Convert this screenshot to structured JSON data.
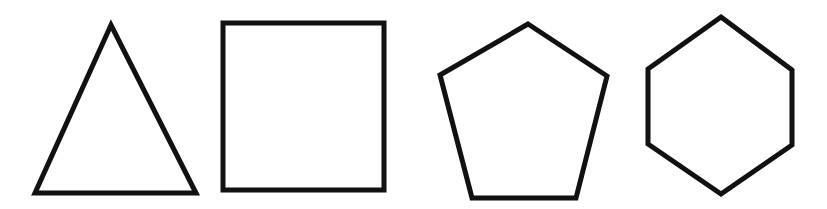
{
  "canvas": {
    "width": 827,
    "height": 209,
    "background": "#ffffff"
  },
  "style": {
    "stroke": "#111111",
    "stroke_width": 5,
    "fill": "none"
  },
  "shapes": [
    {
      "name": "triangle",
      "sides": 3,
      "points": [
        [
          111,
          25
        ],
        [
          35,
          193
        ],
        [
          196,
          193
        ]
      ]
    },
    {
      "name": "square",
      "sides": 4,
      "points": [
        [
          223,
          23
        ],
        [
          384,
          23
        ],
        [
          384,
          190
        ],
        [
          223,
          190
        ]
      ]
    },
    {
      "name": "pentagon",
      "sides": 5,
      "points": [
        [
          528,
          24
        ],
        [
          607,
          76
        ],
        [
          576,
          198
        ],
        [
          472,
          198
        ],
        [
          440,
          75
        ]
      ]
    },
    {
      "name": "hexagon",
      "sides": 6,
      "points": [
        [
          721,
          17
        ],
        [
          792,
          70
        ],
        [
          792,
          145
        ],
        [
          721,
          194
        ],
        [
          648,
          144
        ],
        [
          648,
          69
        ]
      ]
    }
  ]
}
